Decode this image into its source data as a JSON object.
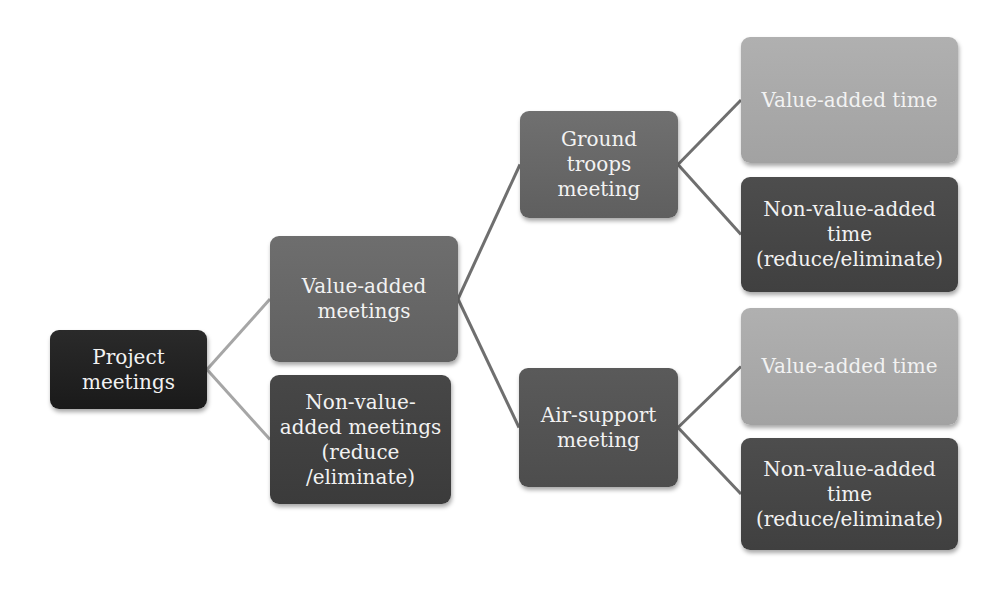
{
  "diagram": {
    "type": "tree",
    "colors": {
      "root_connector": "#a6a6a6",
      "connector": "#6f6f6f",
      "root_box": "#222222",
      "value_added_meetings_box": "#676767",
      "non_value_added_box": "#424242",
      "value_added_time_box": "#a9a9a9"
    },
    "nodes": {
      "root": {
        "label": "Project meetings"
      },
      "value_added_meetings": {
        "label": "Value-added meetings"
      },
      "non_value_added_meetings": {
        "label": "Non-value-added meetings (reduce /eliminate)"
      },
      "ground_troops_meeting": {
        "label": "Ground troops meeting"
      },
      "air_support_meeting": {
        "label": "Air-support meeting"
      },
      "ground_value_added_time": {
        "label": "Value-added time"
      },
      "ground_non_value_added_time": {
        "label": "Non-value-added time (reduce/eliminate)"
      },
      "air_value_added_time": {
        "label": "Value-added time"
      },
      "air_non_value_added_time": {
        "label": "Non-value-added time (reduce/eliminate)"
      }
    },
    "edges": [
      {
        "from": "root",
        "to": "value_added_meetings",
        "style": "root_connector"
      },
      {
        "from": "root",
        "to": "non_value_added_meetings",
        "style": "root_connector"
      },
      {
        "from": "value_added_meetings",
        "to": "ground_troops_meeting",
        "style": "connector"
      },
      {
        "from": "value_added_meetings",
        "to": "air_support_meeting",
        "style": "connector"
      },
      {
        "from": "ground_troops_meeting",
        "to": "ground_value_added_time",
        "style": "connector"
      },
      {
        "from": "ground_troops_meeting",
        "to": "ground_non_value_added_time",
        "style": "connector"
      },
      {
        "from": "air_support_meeting",
        "to": "air_value_added_time",
        "style": "connector"
      },
      {
        "from": "air_support_meeting",
        "to": "air_non_value_added_time",
        "style": "connector"
      }
    ]
  }
}
